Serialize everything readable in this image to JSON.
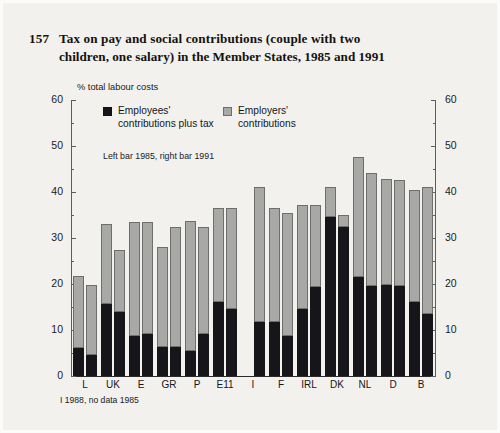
{
  "figure": {
    "number": "157",
    "title_line1": "Tax on pay and social contributions (couple with two",
    "title_line2": "children, one salary) in the Member States, 1985 and 1991"
  },
  "legend": {
    "unit_label": "% total labour costs",
    "series1_line1": "Employees'",
    "series1_line2": "contributions plus tax",
    "series2_line1": "Employers'",
    "series2_line2": "contributions",
    "note": "Left bar 1985, right bar 1991",
    "color_employees": "#16161a",
    "color_employers": "#a8a8a6"
  },
  "footnote": "I 1988, no data 1985",
  "axis": {
    "ticks": [
      "60",
      "50",
      "40",
      "30",
      "20",
      "10",
      "0"
    ],
    "tick_values": [
      60,
      50,
      40,
      30,
      20,
      10,
      0
    ],
    "minor_tick_values": [
      55,
      45,
      35,
      25,
      15,
      5
    ]
  },
  "chart_data": {
    "type": "bar",
    "title": "Tax on pay and social contributions (couple with two children, one salary) in the Member States, 1985 and 1991",
    "xlabel": "",
    "ylabel": "% total labour costs",
    "ylim": [
      0,
      60
    ],
    "grid": false,
    "stacked": true,
    "legend_position": "top-inside",
    "categories": [
      "L",
      "UK",
      "E",
      "GR",
      "P",
      "E11",
      "I",
      "F",
      "IRL",
      "DK",
      "NL",
      "D",
      "B"
    ],
    "groups": [
      {
        "name": "1985",
        "series": [
          {
            "name": "Employees' contributions plus tax",
            "values": [
              6.0,
              15.7,
              8.8,
              6.3,
              5.5,
              16.0,
              null,
              11.8,
              14.6,
              34.6,
              21.5,
              19.7,
              16.0
            ]
          },
          {
            "name": "Employers' contributions",
            "values": [
              15.8,
              17.3,
              24.6,
              21.7,
              28.2,
              20.5,
              null,
              24.7,
              22.6,
              6.4,
              26.1,
              23.1,
              24.5
            ]
          }
        ],
        "totals": [
          21.8,
          33.0,
          33.4,
          28.0,
          33.7,
          36.5,
          null,
          36.5,
          37.2,
          41.0,
          47.6,
          42.8,
          40.5
        ]
      },
      {
        "name": "1991",
        "series": [
          {
            "name": "Employees' contributions plus tax",
            "values": [
              4.5,
              13.9,
              9.2,
              6.2,
              9.1,
              14.6,
              11.8,
              8.8,
              19.3,
              32.5,
              19.6,
              19.5,
              13.4
            ]
          },
          {
            "name": "Employers' contributions",
            "values": [
              15.3,
              13.6,
              24.2,
              26.2,
              23.4,
              21.9,
              29.2,
              26.7,
              17.9,
              2.5,
              24.5,
              23.1,
              27.7
            ]
          }
        ],
        "totals": [
          19.8,
          27.5,
          33.4,
          32.4,
          32.5,
          36.5,
          41.0,
          35.5,
          37.2,
          35.0,
          44.1,
          42.6,
          41.1
        ]
      }
    ]
  }
}
